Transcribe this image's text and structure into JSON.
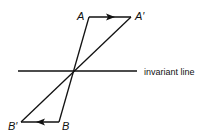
{
  "diagram": {
    "points": {
      "A": {
        "label": "A",
        "x": 89,
        "y": 17
      },
      "A_prime": {
        "label": "A′",
        "x": 131,
        "y": 17
      },
      "B": {
        "label": "B",
        "x": 59,
        "y": 122
      },
      "B_prime": {
        "label": "B′",
        "x": 21,
        "y": 122
      },
      "O": {
        "x": 73,
        "y": 71
      }
    },
    "invariant_line": {
      "label": "invariant line",
      "x1": 18,
      "x2": 137,
      "y": 71
    },
    "colors": {
      "stroke": "#111111",
      "background": "#ffffff"
    }
  }
}
